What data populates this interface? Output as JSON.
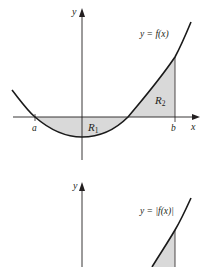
{
  "figure": {
    "top_graph": {
      "y_axis_label": "y",
      "x_axis_label": "x",
      "curve_label": "y = f(x)",
      "left_bound_label": "a",
      "right_bound_label": "b",
      "region_1": {
        "letter": "R",
        "subscript": "1"
      },
      "region_2": {
        "letter": "R",
        "subscript": "2"
      }
    },
    "bottom_graph": {
      "y_axis_label": "y",
      "curve_label": "y = |f(x)|"
    },
    "colors": {
      "curve": "#1a1a1a",
      "axis": "#231f20",
      "shading": "#d9d9d9"
    }
  }
}
